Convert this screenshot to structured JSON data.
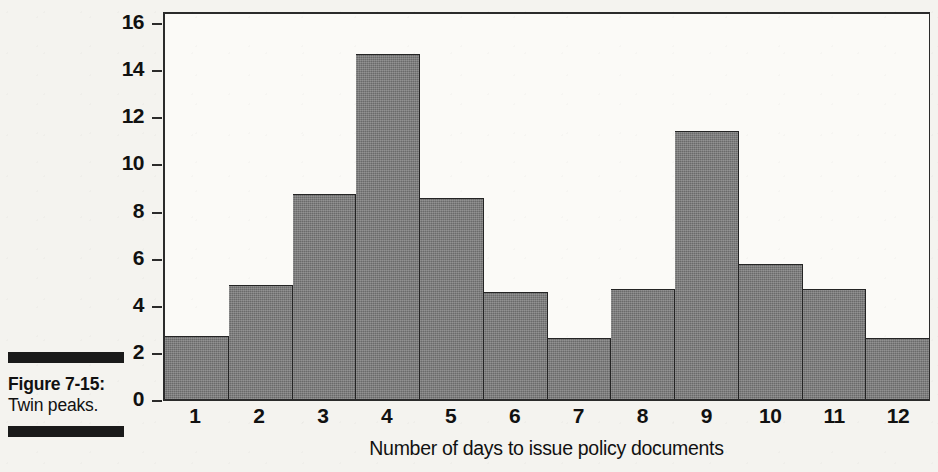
{
  "caption": {
    "title": "Figure 7-15:",
    "text": "Twin peaks."
  },
  "colors": {
    "bar_fill": "#6a6a6a",
    "bar_stroke": "#242424",
    "axis": "#2b2b2b",
    "paper": "#f4f3ef",
    "plot_background": "#fbfaf7",
    "text": "#111111"
  },
  "chart_data": {
    "type": "bar",
    "title": "",
    "subtitle": "",
    "xlabel": "Number of days to issue policy documents",
    "ylabel": "",
    "categories": [
      "1",
      "2",
      "3",
      "4",
      "5",
      "6",
      "7",
      "8",
      "9",
      "10",
      "11",
      "12"
    ],
    "values": [
      2.7,
      4.9,
      8.8,
      14.8,
      8.6,
      4.6,
      2.6,
      4.7,
      11.5,
      5.8,
      4.7,
      2.6
    ],
    "ylim": [
      0,
      16
    ],
    "yticks": [
      0,
      2,
      4,
      6,
      8,
      10,
      12,
      14,
      16
    ],
    "ytick_labels": [
      "0",
      "2",
      "4",
      "6",
      "8",
      "10",
      "12",
      "14",
      "16"
    ],
    "xtick_labels": [
      "1",
      "2",
      "3",
      "4",
      "5",
      "6",
      "7",
      "8",
      "9",
      "10",
      "11",
      "12"
    ],
    "grid": false,
    "legend": null,
    "annotations": []
  }
}
